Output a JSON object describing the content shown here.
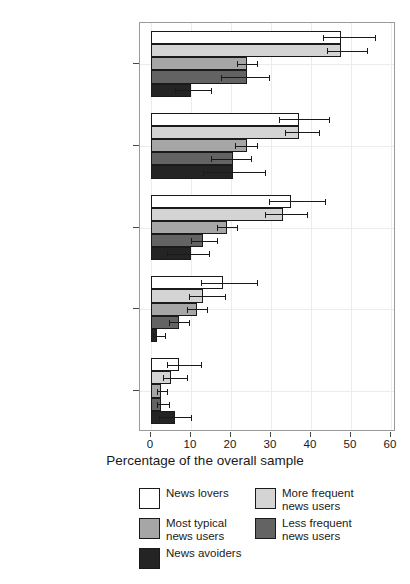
{
  "chart_data": {
    "type": "bar",
    "orientation": "horizontal",
    "title": "",
    "xlabel": "Percentage of the overall sample",
    "ylabel": "",
    "xlim": [
      0,
      60
    ],
    "xticks": [
      0,
      10,
      20,
      30,
      40,
      50,
      60
    ],
    "xticklabels": [
      "0",
      "10",
      "20",
      "30",
      "40",
      "50",
      "60"
    ],
    "grid": true,
    "legend_position": "bottom",
    "categories": [
      "Been interviewed\nby a journalist\nfor a news story",
      "Known a journalist\npersonally",
      "Contacted a journalist\nwith ideas or feedback",
      "Known a journalist\npersonally (who was a\nclose friend or\nfamily member)",
      "Worked as a\nprofessional journalist"
    ],
    "series": [
      {
        "name": "News lovers",
        "color": "#ffffff",
        "values": [
          47.5,
          37.0,
          35.0,
          18.0,
          7.0
        ],
        "err_low": [
          43.0,
          32.0,
          29.5,
          12.5,
          4.0
        ],
        "err_high": [
          56.0,
          44.5,
          43.5,
          26.5,
          12.5
        ]
      },
      {
        "name": "More frequent\nnews users",
        "color": "#d4d4d4",
        "values": [
          47.5,
          37.0,
          33.0,
          13.0,
          5.0
        ],
        "err_low": [
          44.0,
          33.5,
          28.5,
          9.5,
          3.0
        ],
        "err_high": [
          54.0,
          42.0,
          39.0,
          18.5,
          9.0
        ]
      },
      {
        "name": "Most typical\nnews users",
        "color": "#a6a6a6",
        "values": [
          24.0,
          24.0,
          19.0,
          11.5,
          2.5
        ],
        "err_low": [
          21.5,
          21.0,
          16.5,
          9.0,
          1.5
        ],
        "err_high": [
          26.5,
          26.5,
          21.5,
          14.0,
          4.0
        ]
      },
      {
        "name": "Less frequent\nnews users",
        "color": "#636363",
        "values": [
          24.0,
          20.5,
          13.0,
          7.0,
          2.5
        ],
        "err_low": [
          17.5,
          15.0,
          10.0,
          4.5,
          1.5
        ],
        "err_high": [
          29.5,
          25.0,
          16.5,
          9.5,
          4.5
        ]
      },
      {
        "name": "News avoiders",
        "color": "#242424",
        "values": [
          10.0,
          20.5,
          10.0,
          1.5,
          6.0
        ],
        "err_low": [
          6.0,
          13.0,
          4.0,
          0.5,
          2.0
        ],
        "err_high": [
          15.0,
          28.5,
          14.5,
          3.5,
          10.0
        ]
      }
    ],
    "legend_entries": [
      {
        "label": "News lovers",
        "color": "#ffffff"
      },
      {
        "label": "Most typical\nnews users",
        "color": "#a6a6a6"
      },
      {
        "label": "News avoiders",
        "color": "#242424"
      },
      {
        "label": "More frequent\nnews users",
        "color": "#d4d4d4"
      },
      {
        "label": "Less frequent\nnews users",
        "color": "#636363"
      }
    ]
  },
  "axis": {
    "x_title": "Percentage of the overall sample",
    "x_tick_labels": [
      "0",
      "10",
      "20",
      "30",
      "40",
      "50",
      "60"
    ],
    "y_tick_labels": [
      "Been interviewed\nby a journalist\nfor a news story",
      "Known a journalist\npersonally",
      "Contacted a journalist\nwith ideas or feedback",
      "Known a journalist\npersonally (who was a\nclose friend or\nfamily member)",
      "Worked as a\nprofessional journalist"
    ]
  },
  "legend": {
    "left_column": [
      {
        "label": "News lovers",
        "color": "#ffffff"
      },
      {
        "label": "Most typical\nnews users",
        "color": "#a6a6a6"
      },
      {
        "label": "News avoiders",
        "color": "#242424"
      }
    ],
    "right_column": [
      {
        "label": "More frequent\nnews users",
        "color": "#d4d4d4"
      },
      {
        "label": "Less frequent\nnews users",
        "color": "#636363"
      }
    ]
  }
}
